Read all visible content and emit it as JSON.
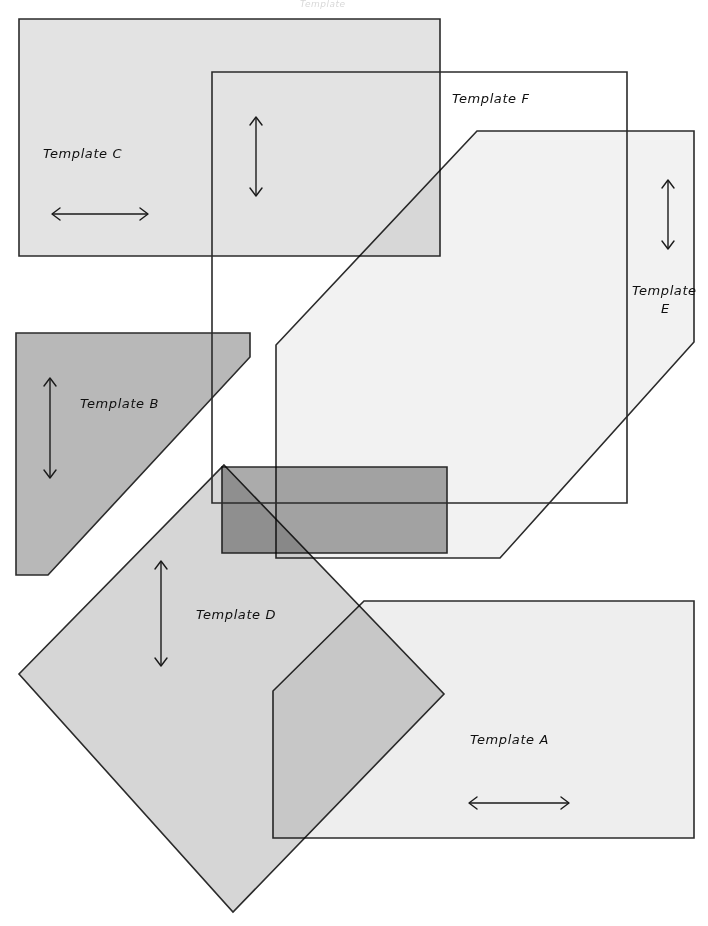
{
  "page": {
    "title_faint": "Template",
    "background_color": "#ffffff",
    "width": 708,
    "height": 926
  },
  "palette": {
    "stroke": "#2b2b2b",
    "fill_light": "#e8e8e8",
    "fill_lighter": "#f0f0f0",
    "fill_medium": "#d5d5d5",
    "fill_dark": "#b3b3b3",
    "fill_none": "none",
    "label_color": "#101010"
  },
  "templates": [
    {
      "id": "template-a",
      "label": "Template A",
      "label_pos": {
        "x": 470,
        "y": 744
      },
      "fill": "#eeeeee",
      "points": "473,601 694,601 694,838 273,838 273,691 364,601 473,601",
      "arrow": {
        "type": "horizontal",
        "x1": 469,
        "y1": 803,
        "x2": 569,
        "y2": 803
      }
    },
    {
      "id": "template-b",
      "label": "Template B",
      "label_pos": {
        "x": 80,
        "y": 408
      },
      "fill": "#b8b8b8",
      "points": "16,333 250,333 250,357 48,575 16,575 16,333",
      "arrow": {
        "type": "vertical",
        "x1": 50,
        "y1": 378,
        "x2": 50,
        "y2": 478
      }
    },
    {
      "id": "template-c",
      "label": "Template C",
      "label_pos": {
        "x": 43,
        "y": 158
      },
      "fill": "#e3e3e3",
      "points": "19,19 440,19 440,256 19,256 19,19",
      "arrow": {
        "type": "horizontal",
        "x1": 52,
        "y1": 214,
        "x2": 148,
        "y2": 214
      }
    },
    {
      "id": "template-d",
      "label": "Template D",
      "label_pos": {
        "x": 196,
        "y": 619
      },
      "fill": "#d6d6d6",
      "points": "224,465 444,694 233,912 19,674 224,465",
      "arrow": {
        "type": "vertical",
        "x1": 161,
        "y1": 561,
        "x2": 161,
        "y2": 666
      }
    },
    {
      "id": "template-e",
      "label": "Template E",
      "label_sub": "E",
      "label_pos": {
        "x": 632,
        "y": 292
      },
      "label_sub_pos": {
        "x": 660,
        "y": 309
      },
      "fill": "#f2f2f2",
      "points": "477,131 694,131 694,342 500,558 276,558 276,345 477,131",
      "arrow": {
        "type": "vertical",
        "x1": 668,
        "y1": 180,
        "x2": 668,
        "y2": 249
      }
    },
    {
      "id": "template-f",
      "label": "Template F",
      "label_pos": {
        "x": 452,
        "y": 103
      },
      "fill": "none",
      "points": "212,72 627,72 627,503 212,503 212,72",
      "arrow": {
        "type": "vertical",
        "x1": 256,
        "y1": 117,
        "x2": 256,
        "y2": 196
      }
    },
    {
      "id": "template-overlap-band",
      "label": "",
      "fill": "#ababab",
      "points": "222,467 447,467 447,553 222,553 222,467"
    }
  ],
  "arrows": {
    "horizontal_icon": "double-arrow-horizontal",
    "vertical_icon": "double-arrow-vertical"
  }
}
